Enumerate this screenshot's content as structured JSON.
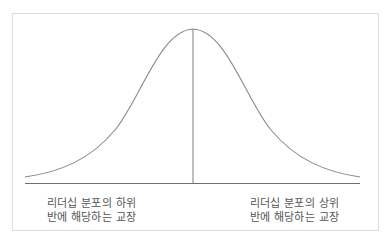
{
  "diagram": {
    "type": "normal-distribution-curve",
    "colors": {
      "curve": "#8a8a8a",
      "center_line": "#8a8a8a",
      "baseline": "#6e6e6e",
      "frame": "#dcdcdc",
      "text": "#555555"
    },
    "labels": {
      "left": {
        "line1": "리더십 분포의 하위",
        "line2": "반에 해당하는 교장"
      },
      "right": {
        "line1": "리더십 분포의 상위",
        "line2": "반에 해당하는 교장"
      }
    }
  }
}
